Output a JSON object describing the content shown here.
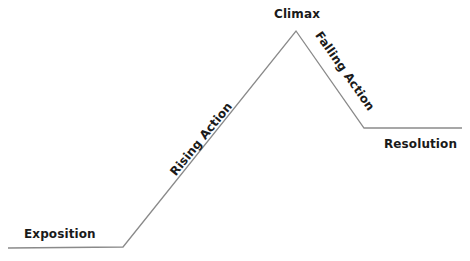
{
  "diagram": {
    "type": "plot-structure",
    "title": "",
    "line_color": "#8a8a8a",
    "text_color": "#1a1a1a",
    "points": {
      "start": [
        8,
        248
      ],
      "rise_start": [
        123,
        247
      ],
      "climax": [
        296,
        31
      ],
      "fall_end": [
        364,
        128
      ],
      "end": [
        462,
        128
      ]
    },
    "labels": {
      "exposition": "Exposition",
      "rising_action": "Rising Action",
      "climax": "Climax",
      "falling_action": "Falling Action",
      "resolution": "Resolution"
    }
  }
}
